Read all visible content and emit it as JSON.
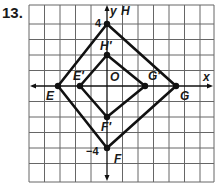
{
  "problem": {
    "number": "13."
  },
  "axes": {
    "x_label": "x",
    "y_label": "y",
    "ticks": {
      "y_top": "4",
      "y_bottom": "−4"
    }
  },
  "origin_label": "O",
  "points": {
    "H": {
      "label": "H",
      "x": 0,
      "y": 4
    },
    "E": {
      "label": "E",
      "x": -4,
      "y": 0
    },
    "G": {
      "label": "G",
      "x": 4,
      "y": 0
    },
    "F": {
      "label": "F",
      "x": 0,
      "y": -4
    },
    "H_prime": {
      "label": "H′",
      "x": 0,
      "y": 2
    },
    "E_prime": {
      "label": "E′",
      "x": -2,
      "y": 0
    },
    "G_prime": {
      "label": "G′",
      "x": 2,
      "y": 0
    },
    "F_prime": {
      "label": "F′",
      "x": 0,
      "y": -2
    }
  },
  "shapes": [
    {
      "name": "square-EHGF",
      "vertices": [
        "E",
        "H",
        "G",
        "F"
      ]
    },
    {
      "name": "square-E'H'G'F'",
      "vertices": [
        "E'",
        "H'",
        "G'",
        "F'"
      ]
    }
  ],
  "grid": {
    "x_range": [
      -5,
      7
    ],
    "y_range": [
      -6,
      5
    ],
    "line_color": "#555555",
    "shape_color": "#111111"
  }
}
